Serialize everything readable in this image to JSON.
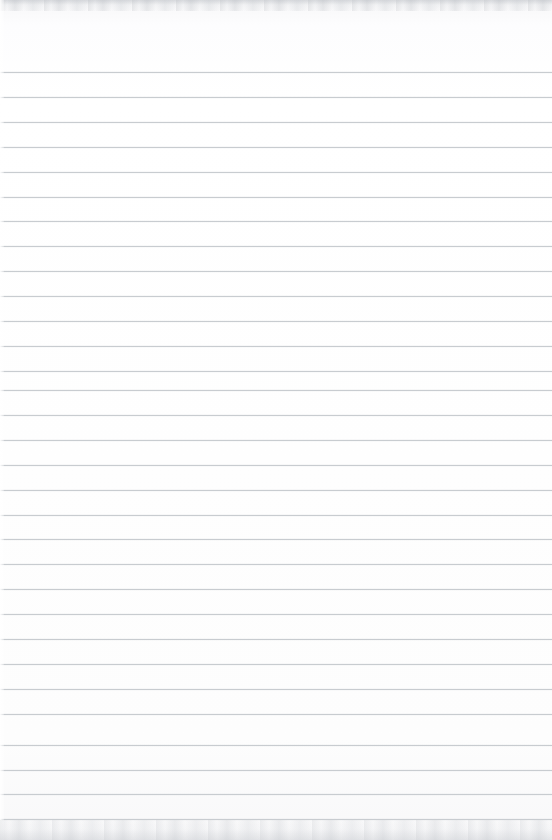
{
  "document": {
    "kind": "scanned-ruled-notebook-paper",
    "title": "",
    "written_text": "",
    "page_number": "",
    "width_px": 552,
    "height_px": 840
  },
  "paper": {
    "background_color": "#fdfdfd",
    "edge_band_color": "#c4c7cc",
    "left_highlight_color": "#ffffff"
  },
  "ruling": {
    "line_color": "#c6cace",
    "line_thickness_px": 1,
    "line_spacing_px": 24.9,
    "first_line_y_px": 72,
    "line_count": 31,
    "margin_rule_visible": false,
    "lines_y": [
      72.0,
      96.9,
      121.8,
      146.7,
      171.6,
      196.5,
      221.4,
      246.3,
      271.2,
      296.1,
      321.0,
      345.9,
      370.8,
      390.0,
      414.9,
      439.8,
      464.7,
      489.6,
      514.5,
      539.4,
      564.3,
      589.2,
      614.1,
      639.0,
      663.9,
      688.8,
      713.7,
      745.0,
      769.5,
      794.0,
      818.5
    ]
  }
}
